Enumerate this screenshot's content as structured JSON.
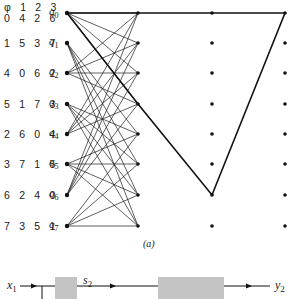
{
  "figure": {
    "caption": "(a)",
    "trellis": {
      "states": [
        {
          "name": "q",
          "index": "0",
          "labels": [
            "φ 1 2 3",
            "0 4 2 6"
          ]
        },
        {
          "name": "q",
          "index": "1",
          "labels": [
            "1 5 3 7"
          ]
        },
        {
          "name": "q",
          "index": "2",
          "labels": [
            "4 0 6 2"
          ]
        },
        {
          "name": "q",
          "index": "3",
          "labels": [
            "5 1 7 3"
          ]
        },
        {
          "name": "q",
          "index": "4",
          "labels": [
            "2 6 0 4"
          ]
        },
        {
          "name": "q",
          "index": "5",
          "labels": [
            "3 7 1 5"
          ]
        },
        {
          "name": "q",
          "index": "6",
          "labels": [
            "6 2 4 0"
          ]
        },
        {
          "name": "q",
          "index": "7",
          "labels": [
            "7 3 5 1"
          ]
        }
      ],
      "columns_x": [
        67,
        138,
        212,
        285
      ],
      "rows_y": [
        13,
        43,
        73,
        104,
        134,
        164,
        195,
        226
      ],
      "highlighted_path": [
        [
          0,
          0
        ],
        [
          1,
          0
        ],
        [
          2,
          0
        ],
        [
          3,
          0
        ]
      ],
      "error_path": [
        [
          0,
          0
        ],
        [
          1,
          3
        ],
        [
          2,
          6
        ],
        [
          3,
          0
        ]
      ]
    },
    "block_diagram": {
      "input_label": "x",
      "input_sub": "1",
      "mid_label": "s",
      "mid_sub": "2",
      "output_label": "y",
      "output_sub": "2"
    },
    "colors": {
      "line": "#1a1a1a",
      "block": "#c4c4c4"
    }
  }
}
